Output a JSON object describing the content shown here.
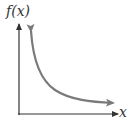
{
  "diagram": {
    "type": "function-graph",
    "y_axis_label": "f(x)",
    "x_axis_label": "x",
    "colors": {
      "axes": "#333333",
      "curve": "#7a7a7a",
      "background": "#ffffff"
    }
  }
}
